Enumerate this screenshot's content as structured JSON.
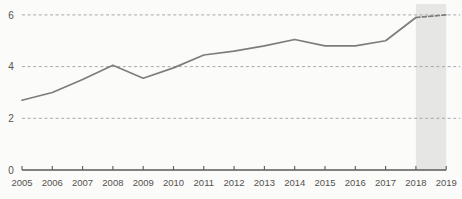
{
  "chart_data": {
    "type": "line",
    "title": "",
    "subtitle": "",
    "xlabel": "",
    "ylabel": "",
    "categories": [
      "2005",
      "2006",
      "2007",
      "2008",
      "2009",
      "2010",
      "2011",
      "2012",
      "2013",
      "2014",
      "2015",
      "2016",
      "2017",
      "2018",
      "2019"
    ],
    "values": [
      2.7,
      3.0,
      3.5,
      4.05,
      3.55,
      3.95,
      4.45,
      4.6,
      4.8,
      5.05,
      4.8,
      4.8,
      5.0,
      5.9,
      6.0
    ],
    "series": [
      {
        "name": "",
        "values": [
          2.7,
          3.0,
          3.5,
          4.05,
          3.55,
          3.95,
          4.45,
          4.6,
          4.8,
          5.05,
          4.8,
          4.8,
          5.0,
          5.9,
          6.0
        ]
      }
    ],
    "xlim": [
      "2005",
      "2019"
    ],
    "ylim": [
      0,
      6
    ],
    "y_ticks": [
      0,
      2,
      4,
      6
    ],
    "y_tick_labels": [
      "0",
      "2",
      "4",
      "6"
    ],
    "x_tick_labels": [
      "2005",
      "2006",
      "2007",
      "2008",
      "2009",
      "2010",
      "2011",
      "2012",
      "2013",
      "2014",
      "2015",
      "2016",
      "2017",
      "2018",
      "2019"
    ],
    "grid": true,
    "grid_style": "dashed",
    "grid_axis": "y",
    "legend": "none",
    "legend_position": "none",
    "annotations": [],
    "forecast_segment": {
      "from_category": "2018",
      "to_category": "2019",
      "line_style": "dashed",
      "shaded": true
    },
    "shaded_region": {
      "from_category": "2018",
      "to_category": "2019"
    },
    "colors": {
      "line": "#7d7d7d",
      "grid": "#9aa0a6",
      "axis": "#5d5a57",
      "text": "#55524f",
      "shaded_band": "#e6e6e4",
      "background": "#fbfbf9"
    }
  }
}
